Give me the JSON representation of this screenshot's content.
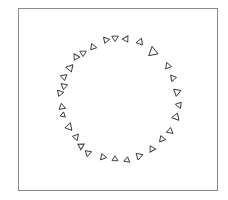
{
  "figure": {
    "frame_color": "#8a8a8a",
    "stroke_color": "#333333",
    "fill_color": "#ffffff",
    "triangle_count": 30,
    "triangles": [
      {
        "x": 106,
        "y": 40,
        "rot": 200,
        "size": 6
      },
      {
        "x": 115,
        "y": 38,
        "rot": 180,
        "size": 6
      },
      {
        "x": 126,
        "y": 39,
        "rot": 150,
        "size": 6
      },
      {
        "x": 140,
        "y": 42,
        "rot": 140,
        "size": 6.5
      },
      {
        "x": 153,
        "y": 52,
        "rot": 110,
        "size": 9
      },
      {
        "x": 168,
        "y": 66,
        "rot": 100,
        "size": 6
      },
      {
        "x": 173,
        "y": 78,
        "rot": 80,
        "size": 6
      },
      {
        "x": 177,
        "y": 92,
        "rot": 70,
        "size": 7
      },
      {
        "x": 179,
        "y": 105,
        "rot": 40,
        "size": 6
      },
      {
        "x": 176,
        "y": 117,
        "rot": 20,
        "size": 7
      },
      {
        "x": 170,
        "y": 131,
        "rot": 10,
        "size": 6
      },
      {
        "x": 162,
        "y": 139,
        "rot": 340,
        "size": 6
      },
      {
        "x": 152,
        "y": 149,
        "rot": 330,
        "size": 6
      },
      {
        "x": 139,
        "y": 156,
        "rot": 310,
        "size": 6.5
      },
      {
        "x": 127,
        "y": 160,
        "rot": 10,
        "size": 5.5
      },
      {
        "x": 115,
        "y": 159,
        "rot": 0,
        "size": 5.5
      },
      {
        "x": 103,
        "y": 157,
        "rot": 340,
        "size": 6
      },
      {
        "x": 88,
        "y": 153,
        "rot": 310,
        "size": 6
      },
      {
        "x": 81,
        "y": 146,
        "rot": 300,
        "size": 6
      },
      {
        "x": 76,
        "y": 137,
        "rot": 280,
        "size": 6
      },
      {
        "x": 69,
        "y": 127,
        "rot": 260,
        "size": 7
      },
      {
        "x": 63,
        "y": 115,
        "rot": 250,
        "size": 5
      },
      {
        "x": 62,
        "y": 107,
        "rot": 230,
        "size": 6
      },
      {
        "x": 60,
        "y": 93,
        "rot": 200,
        "size": 6
      },
      {
        "x": 64,
        "y": 86,
        "rot": 190,
        "size": 6
      },
      {
        "x": 64,
        "y": 77,
        "rot": 170,
        "size": 6
      },
      {
        "x": 70,
        "y": 68,
        "rot": 160,
        "size": 7
      },
      {
        "x": 76,
        "y": 57,
        "rot": 210,
        "size": 6
      },
      {
        "x": 83,
        "y": 53,
        "rot": 180,
        "size": 6
      },
      {
        "x": 93,
        "y": 47,
        "rot": 220,
        "size": 6
      }
    ]
  }
}
